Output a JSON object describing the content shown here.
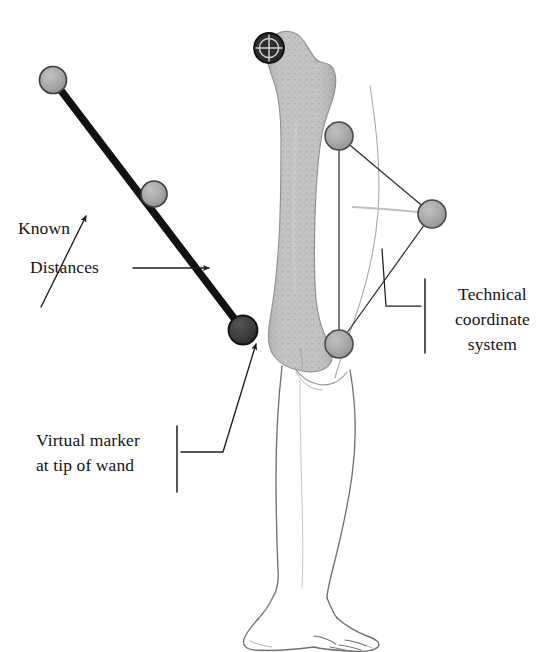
{
  "figure": {
    "background_color": "#ffffff",
    "width": 542,
    "height": 652
  },
  "labels": {
    "known": "Known",
    "distances": "Distances",
    "virtual_marker": "Virtual marker\nat tip of wand",
    "technical_coordinate_system": "Technical\ncoordinate\nsystem"
  },
  "colors": {
    "ink": "#141414",
    "rod": "#111111",
    "marker_light": "#a8a8a8",
    "marker_light_stroke": "#4a4a4a",
    "marker_dark": "#3a3a3a",
    "marker_dark_stroke": "#141414",
    "bone_fill": "#bdbdbd",
    "bone_stroke": "#8a8a8a",
    "limb_outline": "#6d6d6d",
    "leader_line": "#3a3a3a",
    "cluster_line": "#2e2e2e"
  },
  "markers": [
    {
      "name": "wand-marker-proximal",
      "cx": 53,
      "cy": 80,
      "r": 13.5,
      "style": "light",
      "label": "wand top marker"
    },
    {
      "name": "wand-marker-middle",
      "cx": 154,
      "cy": 194,
      "r": 13.0,
      "style": "light",
      "label": "wand middle marker"
    },
    {
      "name": "wand-tip-marker",
      "cx": 243,
      "cy": 330,
      "r": 14.5,
      "style": "dark",
      "label": "virtual marker at tip of wand"
    },
    {
      "name": "hip-joint-center-marker",
      "cx": 269,
      "cy": 48,
      "r": 15.0,
      "style": "crosshair",
      "label": "hip joint center"
    },
    {
      "name": "technical-marker-top",
      "cx": 339,
      "cy": 136,
      "r": 14.0,
      "style": "light",
      "label": "technical cluster marker, superior"
    },
    {
      "name": "technical-marker-right",
      "cx": 432,
      "cy": 214,
      "r": 14.0,
      "style": "light",
      "label": "technical cluster marker, lateral"
    },
    {
      "name": "technical-marker-bottom",
      "cx": 339,
      "cy": 344,
      "r": 14.0,
      "style": "light",
      "label": "technical cluster marker, inferior"
    }
  ],
  "wand": {
    "name": "calibration-wand-rod",
    "from": {
      "x": 53,
      "y": 80
    },
    "to": {
      "x": 243,
      "y": 330
    },
    "thickness": 7
  },
  "cluster_edges": [
    {
      "from": "technical-marker-top",
      "to": "technical-marker-right"
    },
    {
      "from": "technical-marker-right",
      "to": "technical-marker-bottom"
    },
    {
      "from": "technical-marker-bottom",
      "to": "technical-marker-top"
    }
  ],
  "leaders": [
    {
      "name": "known-leader-arrow",
      "kind": "arrow",
      "points": "43,305 85,220",
      "target": "wand rod"
    },
    {
      "name": "distances-leader-arrow",
      "kind": "arrow",
      "points": "135,268 207,268",
      "target": "wand rod"
    },
    {
      "name": "virtual-marker-leader",
      "kind": "bracket-arrow",
      "points": "180,452 222,452 258,345",
      "target": "wand tip marker"
    },
    {
      "name": "technical-leader",
      "kind": "bracket-line",
      "points": "422,305 385,305 381,248",
      "target": "technical marker cluster"
    }
  ],
  "brackets": [
    {
      "name": "virtual-marker-bracket",
      "x": 177,
      "y1": 426,
      "y2": 490
    },
    {
      "name": "technical-bracket",
      "x": 424,
      "y1": 278,
      "y2": 352
    }
  ]
}
